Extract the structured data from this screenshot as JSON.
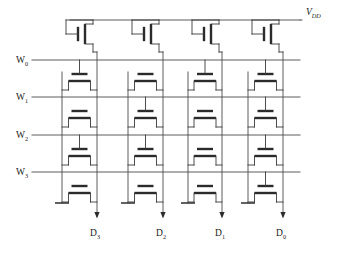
{
  "figure": {
    "kind": "nor-rom-array-schematic",
    "background_color": "#ffffff",
    "wire_color": "#4a4a4a",
    "device_color": "#2b2b2b",
    "label_color": "#1a1a1a",
    "width": 340,
    "height": 255
  },
  "supply": {
    "name": "V",
    "subscript": "DD",
    "label_x": 306,
    "label_y": 15,
    "rail_y": 20,
    "rail_x_start": 70,
    "rail_x_end": 300
  },
  "word_lines": [
    {
      "name": "W",
      "subscript": "0",
      "y": 60,
      "label_x": 16,
      "label_y": 63,
      "x_start": 32,
      "x_end": 300
    },
    {
      "name": "W",
      "subscript": "1",
      "y": 97,
      "label_x": 16,
      "label_y": 100,
      "x_start": 32,
      "x_end": 300
    },
    {
      "name": "W",
      "subscript": "2",
      "y": 135,
      "label_x": 16,
      "label_y": 138,
      "x_start": 32,
      "x_end": 300
    },
    {
      "name": "W",
      "subscript": "3",
      "y": 172,
      "label_x": 16,
      "label_y": 175,
      "x_start": 32,
      "x_end": 300
    }
  ],
  "bit_lines": [
    {
      "name": "D",
      "subscript": "3",
      "x": 97,
      "label_x": 90,
      "label_y": 236,
      "arrow_y": 212,
      "out_y_end": 216
    },
    {
      "name": "D",
      "subscript": "2",
      "x": 163,
      "label_x": 156,
      "label_y": 236,
      "arrow_y": 212,
      "out_y_end": 216
    },
    {
      "name": "D",
      "subscript": "1",
      "x": 222,
      "label_x": 215,
      "label_y": 236,
      "arrow_y": 212,
      "out_y_end": 216
    },
    {
      "name": "D",
      "subscript": "0",
      "x": 283,
      "label_x": 276,
      "label_y": 236,
      "arrow_y": 212,
      "out_y_end": 216
    }
  ],
  "ground_rails": [
    {
      "x": 62,
      "y_top": 72,
      "y_bottom": 203
    },
    {
      "x": 128,
      "y_top": 72,
      "y_bottom": 203
    },
    {
      "x": 188,
      "y_top": 72,
      "y_bottom": 203
    },
    {
      "x": 248,
      "y_top": 72,
      "y_bottom": 203
    }
  ],
  "load_transistors": [
    {
      "id": "pmos-load-d3",
      "type": "pmos",
      "x": 78,
      "y": 34,
      "connects_to_bit_line": "D3"
    },
    {
      "id": "pmos-load-d2",
      "type": "pmos",
      "x": 144,
      "y": 34,
      "connects_to_bit_line": "D2"
    },
    {
      "id": "pmos-load-d1",
      "type": "pmos",
      "x": 204,
      "y": 34,
      "connects_to_bit_line": "D1"
    },
    {
      "id": "pmos-load-d0",
      "type": "pmos",
      "x": 264,
      "y": 34,
      "connects_to_bit_line": "D0"
    }
  ],
  "cell_matrix": {
    "note": "Each NMOS cell: gate connected to word line = programmed; floating gate = unprogrammed.",
    "row_labels": [
      "W0",
      "W1",
      "W2",
      "W3"
    ],
    "column_labels": [
      "D3",
      "D2",
      "D1",
      "D0"
    ],
    "rows": [
      {
        "word_line": "W0",
        "gate_y": 60,
        "device_y": 74,
        "cells": [
          {
            "column": "D3",
            "gnd_x": 62,
            "bl_x": 97,
            "gate_connected": true
          },
          {
            "column": "D2",
            "gnd_x": 128,
            "bl_x": 163,
            "gate_connected": false
          },
          {
            "column": "D1",
            "gnd_x": 188,
            "bl_x": 222,
            "gate_connected": true
          },
          {
            "column": "D0",
            "gnd_x": 248,
            "bl_x": 283,
            "gate_connected": true
          }
        ]
      },
      {
        "word_line": "W1",
        "gate_y": 97,
        "device_y": 111,
        "cells": [
          {
            "column": "D3",
            "gnd_x": 62,
            "bl_x": 97,
            "gate_connected": false
          },
          {
            "column": "D2",
            "gnd_x": 128,
            "bl_x": 163,
            "gate_connected": true
          },
          {
            "column": "D1",
            "gnd_x": 188,
            "bl_x": 222,
            "gate_connected": false
          },
          {
            "column": "D0",
            "gnd_x": 248,
            "bl_x": 283,
            "gate_connected": true
          }
        ]
      },
      {
        "word_line": "W2",
        "gate_y": 135,
        "device_y": 149,
        "cells": [
          {
            "column": "D3",
            "gnd_x": 62,
            "bl_x": 97,
            "gate_connected": true
          },
          {
            "column": "D2",
            "gnd_x": 128,
            "bl_x": 163,
            "gate_connected": true
          },
          {
            "column": "D1",
            "gnd_x": 188,
            "bl_x": 222,
            "gate_connected": false
          },
          {
            "column": "D0",
            "gnd_x": 248,
            "bl_x": 283,
            "gate_connected": true
          }
        ]
      },
      {
        "word_line": "W3",
        "gate_y": 172,
        "device_y": 186,
        "cells": [
          {
            "column": "D3",
            "gnd_x": 62,
            "bl_x": 97,
            "gate_connected": false
          },
          {
            "column": "D2",
            "gnd_x": 128,
            "bl_x": 163,
            "gate_connected": false
          },
          {
            "column": "D1",
            "gnd_x": 188,
            "bl_x": 222,
            "gate_connected": false
          },
          {
            "column": "D0",
            "gnd_x": 248,
            "bl_x": 283,
            "gate_connected": true
          }
        ]
      }
    ]
  }
}
